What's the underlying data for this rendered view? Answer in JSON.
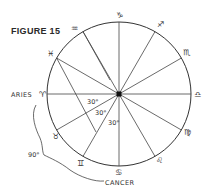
{
  "figure": {
    "title": "FIGURE 15",
    "center": {
      "x": 119,
      "y": 94
    },
    "radius": 72,
    "spoke_angles_deg": [
      0,
      30,
      60,
      90,
      120,
      150,
      180,
      210,
      240,
      270,
      300,
      330
    ],
    "signs": [
      {
        "name": "aries",
        "glyph": "♈",
        "label": "ARIES"
      },
      {
        "name": "taurus",
        "glyph": "♉"
      },
      {
        "name": "gemini",
        "glyph": "♊"
      },
      {
        "name": "cancer",
        "glyph": "♋",
        "label": "CANCER"
      },
      {
        "name": "leo",
        "glyph": "♌"
      },
      {
        "name": "virgo",
        "glyph": "♍"
      },
      {
        "name": "libra",
        "glyph": "♎"
      },
      {
        "name": "scorpio",
        "glyph": "♏"
      },
      {
        "name": "sagittarius",
        "glyph": "♐"
      },
      {
        "name": "capricorn",
        "glyph": "♑"
      },
      {
        "name": "aquarius",
        "glyph": "♒"
      },
      {
        "name": "pisces",
        "glyph": "♓"
      }
    ],
    "angle_labels": [
      "30°",
      "30°",
      "30°"
    ],
    "arc_label": "90°",
    "line_color": "#333333"
  }
}
